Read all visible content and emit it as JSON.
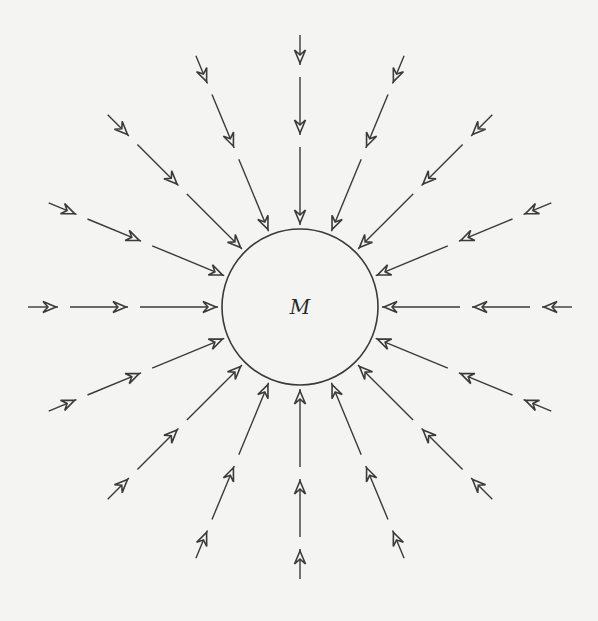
{
  "diagram": {
    "type": "radial-field-lines",
    "mass_label": "M",
    "center": [
      300,
      307
    ],
    "circle_radius": 78,
    "ray_count": 16,
    "ray_angle_step_deg": 22.5,
    "segments_radial": [
      [
        272,
        242
      ],
      [
        230,
        172
      ],
      [
        160,
        82
      ]
    ],
    "arrow_direction": "inward",
    "colors": {
      "background": "#f4f4f2",
      "line": "#3a3a3a"
    }
  }
}
